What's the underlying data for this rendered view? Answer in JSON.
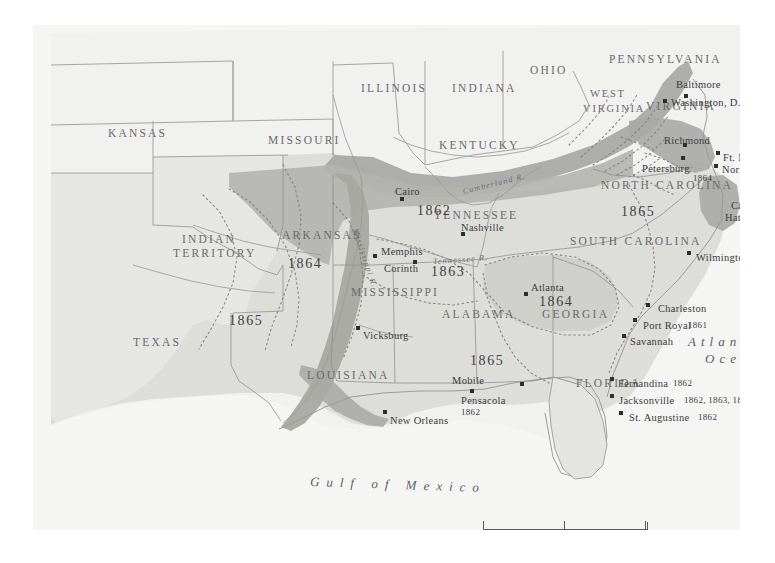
{
  "map": {
    "title": "American Civil War — Union Occupation and Blockade",
    "colors": {
      "paper": "#f3f3f1",
      "land_light": "#ececea",
      "confederacy": "#dcdcd8",
      "occupied_dark": "#a9a9a6",
      "border": "#8d8d8d",
      "text": "#5b5b5b",
      "water": "#f7f7f6"
    },
    "states": [
      {
        "name": "KANSAS",
        "x": 75,
        "y": 103,
        "cls": "state"
      },
      {
        "name": "MISSOURI",
        "x": 235,
        "y": 110,
        "cls": "state"
      },
      {
        "name": "ILLINOIS",
        "x": 328,
        "y": 58,
        "cls": "state"
      },
      {
        "name": "INDIANA",
        "x": 419,
        "y": 58,
        "cls": "state"
      },
      {
        "name": "OHIO",
        "x": 497,
        "y": 40,
        "cls": "state"
      },
      {
        "name": "PENNSYLVANIA",
        "x": 576,
        "y": 29,
        "cls": "state"
      },
      {
        "name": "WEST",
        "x": 557,
        "y": 64,
        "cls": "state sm"
      },
      {
        "name": "VIRGINIA",
        "x": 550,
        "y": 79,
        "cls": "state sm"
      },
      {
        "name": "VIRGINIA",
        "x": 613,
        "y": 76,
        "cls": "state"
      },
      {
        "name": "KENTUCKY",
        "x": 406,
        "y": 115,
        "cls": "state"
      },
      {
        "name": "TENNESSEE",
        "x": 401,
        "y": 185,
        "cls": "state"
      },
      {
        "name": "NORTH CAROLINA",
        "x": 568,
        "y": 155,
        "cls": "state"
      },
      {
        "name": "SOUTH CAROLINA",
        "x": 537,
        "y": 211,
        "cls": "state"
      },
      {
        "name": "GEORGIA",
        "x": 509,
        "y": 284,
        "cls": "state"
      },
      {
        "name": "ALABAMA",
        "x": 409,
        "y": 284,
        "cls": "state"
      },
      {
        "name": "MISSISSIPPI",
        "x": 318,
        "y": 262,
        "cls": "state"
      },
      {
        "name": "LOUISIANA",
        "x": 274,
        "y": 345,
        "cls": "state"
      },
      {
        "name": "FLORIDA",
        "x": 543,
        "y": 353,
        "cls": "state"
      },
      {
        "name": "ARKANSAS",
        "x": 249,
        "y": 205,
        "cls": "state"
      },
      {
        "name": "TEXAS",
        "x": 100,
        "y": 312,
        "cls": "state"
      },
      {
        "name": "INDIAN",
        "x": 149,
        "y": 209,
        "cls": "state"
      },
      {
        "name": "TERRITORY",
        "x": 140,
        "y": 223,
        "cls": "state"
      }
    ],
    "years": [
      {
        "value": "1862",
        "x": 384,
        "y": 179
      },
      {
        "value": "1863",
        "x": 398,
        "y": 240
      },
      {
        "value": "1864",
        "x": 255,
        "y": 232
      },
      {
        "value": "1865",
        "x": 196,
        "y": 289
      },
      {
        "value": "1864",
        "x": 506,
        "y": 270
      },
      {
        "value": "1865",
        "x": 437,
        "y": 329
      },
      {
        "value": "1865",
        "x": 588,
        "y": 180
      }
    ],
    "cities": [
      {
        "name": "Baltimore",
        "lx": 643,
        "ly": 55,
        "dx": 651,
        "dy": 69
      },
      {
        "name": "Washington, D.C.",
        "lx": 638,
        "ly": 73,
        "dx": 630,
        "dy": 74
      },
      {
        "name": "Richmond",
        "lx": 631,
        "ly": 111,
        "dx": 650,
        "dy": 118
      },
      {
        "name": "Petersburg",
        "lx": 609,
        "ly": 139,
        "dx": 648,
        "dy": 131
      },
      {
        "name": "Ft. Monroe",
        "lx": 690,
        "ly": 128,
        "dx": 683,
        "dy": 126
      },
      {
        "name": "Norfolk",
        "lx": 689,
        "ly": 140,
        "dx": 681,
        "dy": 139
      },
      {
        "name": "Cape",
        "lx": 698,
        "ly": 176,
        "dx": 713,
        "dy": 177
      },
      {
        "name": "Hatteras",
        "lx": 692,
        "ly": 188,
        "dx": -99,
        "dy": -99
      },
      {
        "name": "Wilmington",
        "lx": 663,
        "ly": 228,
        "dx": 654,
        "dy": 226
      },
      {
        "name": "Charleston",
        "lx": 625,
        "ly": 279,
        "dx": 613,
        "dy": 278
      },
      {
        "name": "Port Royal",
        "lx": 610,
        "ly": 296,
        "dx": 600,
        "dy": 293
      },
      {
        "name": "Savannah",
        "lx": 597,
        "ly": 312,
        "dx": 589,
        "dy": 309
      },
      {
        "name": "Fernandina",
        "lx": 585,
        "ly": 354,
        "dx": 577,
        "dy": 352
      },
      {
        "name": "Jacksonville",
        "lx": 586,
        "ly": 371,
        "dx": 577,
        "dy": 369
      },
      {
        "name": "St. Augustine",
        "lx": 596,
        "ly": 388,
        "dx": 586,
        "dy": 386
      },
      {
        "name": "Pensacola",
        "lx": 428,
        "ly": 371,
        "dx": 487,
        "dy": 357
      },
      {
        "name": "Mobile",
        "lx": 419,
        "ly": 351,
        "dx": 437,
        "dy": 364
      },
      {
        "name": "New Orleans",
        "lx": 357,
        "ly": 391,
        "dx": 350,
        "dy": 385
      },
      {
        "name": "Vicksburg",
        "lx": 330,
        "ly": 306,
        "dx": 323,
        "dy": 301
      },
      {
        "name": "Atlanta",
        "lx": 498,
        "ly": 258,
        "dx": 491,
        "dy": 267
      },
      {
        "name": "Memphis",
        "lx": 348,
        "ly": 222,
        "dx": 340,
        "dy": 229
      },
      {
        "name": "Corinth",
        "lx": 351,
        "ly": 239,
        "dx": 380,
        "dy": 235
      },
      {
        "name": "Nashville",
        "lx": 428,
        "ly": 198,
        "dx": 428,
        "dy": 207
      },
      {
        "name": "Cairo",
        "lx": 362,
        "ly": 162,
        "dx": 367,
        "dy": 172
      }
    ],
    "city_years": [
      {
        "value": "1861",
        "x": 752,
        "y": 118
      },
      {
        "value": "1862",
        "x": 752,
        "y": 146
      },
      {
        "value": "1864",
        "x": 660,
        "y": 149
      },
      {
        "value": "1861",
        "x": 755,
        "y": 200
      },
      {
        "value": "1861",
        "x": 655,
        "y": 296
      },
      {
        "value": "1862",
        "x": 640,
        "y": 354
      },
      {
        "value": "1862, 1863, 1864",
        "x": 651,
        "y": 371
      },
      {
        "value": "1862",
        "x": 665,
        "y": 388
      },
      {
        "value": "1862",
        "x": 428,
        "y": 383
      }
    ],
    "rivers": [
      {
        "name": "Mississippi R.",
        "x": 322,
        "y": 200,
        "rot": 72
      },
      {
        "name": "Cumberland R.",
        "x": 430,
        "y": 163,
        "rot": -14
      },
      {
        "name": "Tennessee R.",
        "x": 400,
        "y": 233,
        "rot": -4
      }
    ],
    "oceans": [
      {
        "name": "Atlantic",
        "x": 655,
        "y": 310
      },
      {
        "name": "Ocean",
        "x": 672,
        "y": 327
      },
      {
        "name": "Gulf of Mexico",
        "x": 277,
        "y": 453
      }
    ],
    "scale": {
      "x": 450,
      "y": 497,
      "unit": "Miles",
      "ticks": [
        "0",
        "100",
        "200"
      ]
    }
  }
}
